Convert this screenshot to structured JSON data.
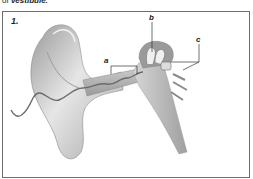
{
  "caption": {
    "prefix": "of ",
    "term": "vestibule."
  },
  "figure": {
    "number": "1.",
    "labels": [
      {
        "id": "a",
        "text": "a"
      },
      {
        "id": "b",
        "text": "b"
      },
      {
        "id": "c",
        "text": "c"
      }
    ],
    "colors": {
      "frame": "#6e6e6e",
      "ear_light": "#e4e4e4",
      "ear_mid": "#bdbdbd",
      "ear_dark": "#8a8a8a",
      "wave": "#6a6a6a"
    }
  }
}
